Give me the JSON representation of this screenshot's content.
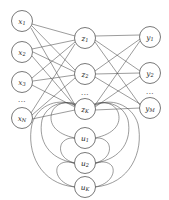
{
  "diagram": {
    "type": "recurrent-neural-network-graph",
    "background_color": "#ffffff",
    "node_fill": "#ffffff",
    "node_stroke": "#555555",
    "edge_color": "#4a4a4a",
    "layers": [
      {
        "name": "input-layer",
        "id": "x",
        "cx": 22,
        "r": 10.5,
        "nodes": [
          {
            "id": "x1",
            "base": "x",
            "sub": "1",
            "cy": 21
          },
          {
            "id": "x2",
            "base": "x",
            "sub": "2",
            "cy": 52
          },
          {
            "id": "x3",
            "base": "x",
            "sub": "3",
            "cy": 82
          },
          {
            "id": "xN",
            "base": "x",
            "sub": "N",
            "cy": 118
          }
        ],
        "ellipsis": {
          "text": "...",
          "cy": 100
        }
      },
      {
        "name": "hidden-layer",
        "id": "z",
        "cx": 85,
        "r": 10.5,
        "nodes": [
          {
            "id": "z1",
            "base": "z",
            "sub": "1",
            "cy": 38
          },
          {
            "id": "z2",
            "base": "z",
            "sub": "2",
            "cy": 74
          },
          {
            "id": "zK",
            "base": "z",
            "sub": "K",
            "cy": 109
          }
        ],
        "ellipsis": {
          "text": "...",
          "cy": 93
        }
      },
      {
        "name": "context-layer",
        "id": "u",
        "cx": 85,
        "r": 10.5,
        "nodes": [
          {
            "id": "u1",
            "base": "u",
            "sub": "1",
            "cy": 138
          },
          {
            "id": "u2",
            "base": "u",
            "sub": "2",
            "cy": 163
          },
          {
            "id": "uK",
            "base": "u",
            "sub": "K",
            "cy": 187
          }
        ],
        "ellipsis": null
      },
      {
        "name": "output-layer",
        "id": "y",
        "cx": 150,
        "r": 10.5,
        "nodes": [
          {
            "id": "y1",
            "base": "y",
            "sub": "1",
            "cy": 37
          },
          {
            "id": "y2",
            "base": "y",
            "sub": "2",
            "cy": 73
          },
          {
            "id": "yM",
            "base": "y",
            "sub": "M",
            "cy": 108
          }
        ],
        "ellipsis": {
          "text": "...",
          "cy": 92
        }
      }
    ],
    "connections": {
      "input_to_hidden": [
        [
          "x1",
          "z1"
        ],
        [
          "x1",
          "z2"
        ],
        [
          "x1",
          "zK"
        ],
        [
          "x2",
          "z1"
        ],
        [
          "x2",
          "z2"
        ],
        [
          "x2",
          "zK"
        ],
        [
          "x3",
          "z1"
        ],
        [
          "x3",
          "z2"
        ],
        [
          "x3",
          "zK"
        ],
        [
          "xN",
          "z1"
        ],
        [
          "xN",
          "z2"
        ],
        [
          "xN",
          "zK"
        ]
      ],
      "hidden_to_output": [
        [
          "z1",
          "y1"
        ],
        [
          "z1",
          "y2"
        ],
        [
          "z1",
          "yM"
        ],
        [
          "z2",
          "y1"
        ],
        [
          "z2",
          "y2"
        ],
        [
          "z2",
          "yM"
        ],
        [
          "zK",
          "y1"
        ],
        [
          "zK",
          "y2"
        ],
        [
          "zK",
          "yM"
        ]
      ],
      "context_recurrent": [
        [
          "u1",
          "z1"
        ],
        [
          "u1",
          "zK"
        ],
        [
          "u2",
          "z1"
        ],
        [
          "u2",
          "zK"
        ],
        [
          "uK",
          "z1"
        ],
        [
          "uK",
          "zK"
        ]
      ]
    }
  }
}
